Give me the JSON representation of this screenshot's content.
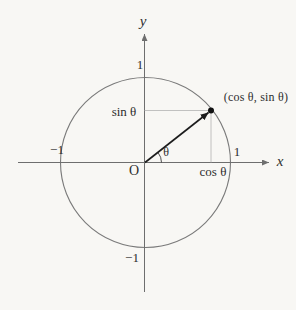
{
  "figure": {
    "labels": {
      "y_axis": "y",
      "x_axis": "x",
      "origin": "O",
      "theta": "θ",
      "sin_theta": "sin θ",
      "cos_theta": "cos θ",
      "point": "(cos θ, sin θ)",
      "one_top": "1",
      "one_right": "1",
      "minus_one_left": "−1",
      "minus_one_bottom": "−1"
    },
    "colors": {
      "background": "#f8f7f4",
      "axis": "#6e6e6e",
      "circle": "#7a7a7a",
      "vector": "#1c1c1c",
      "projection": "#b3b3b3",
      "arc": "#3c3c3c",
      "point": "#111111",
      "text": "#2e2e2e"
    }
  }
}
